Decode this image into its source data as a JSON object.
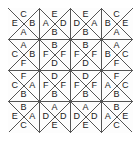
{
  "figure": {
    "kind": "triangle-tiling-letter-grid",
    "rows": 4,
    "cols": 4,
    "cell_size_px": 31,
    "origin_x_px": 8,
    "origin_y_px": 8,
    "line_color": "#555555",
    "border_color": "#444444",
    "background_color": "#fdfdfd",
    "letter_color": "#1a1a1a"
  },
  "legend": {
    "letters": [
      "A",
      "B",
      "C",
      "D",
      "E",
      "F"
    ]
  },
  "cells": [
    {
      "row": 0,
      "col": 0,
      "top": "C",
      "left": "E",
      "right": "B",
      "bottom": "A"
    },
    {
      "row": 0,
      "col": 1,
      "top": "E",
      "left": "A",
      "right": "D",
      "bottom": "B"
    },
    {
      "row": 0,
      "col": 2,
      "top": "E",
      "left": "D",
      "right": "A",
      "bottom": "B"
    },
    {
      "row": 0,
      "col": 3,
      "top": "C",
      "left": "B",
      "right": "E",
      "bottom": "A"
    },
    {
      "row": 1,
      "col": 0,
      "top": "A",
      "left": "C",
      "right": "B",
      "bottom": "F"
    },
    {
      "row": 1,
      "col": 1,
      "top": "B",
      "left": "F",
      "right": "F",
      "bottom": "D"
    },
    {
      "row": 1,
      "col": 2,
      "top": "B",
      "left": "F",
      "right": "F",
      "bottom": "D"
    },
    {
      "row": 1,
      "col": 3,
      "top": "A",
      "left": "B",
      "right": "C",
      "bottom": "F"
    },
    {
      "row": 2,
      "col": 0,
      "top": "F",
      "left": "C",
      "right": "A",
      "bottom": "B"
    },
    {
      "row": 2,
      "col": 1,
      "top": "D",
      "left": "F",
      "right": "F",
      "bottom": "B"
    },
    {
      "row": 2,
      "col": 2,
      "top": "D",
      "left": "F",
      "right": "F",
      "bottom": "B"
    },
    {
      "row": 2,
      "col": 3,
      "top": "F",
      "left": "A",
      "right": "C",
      "bottom": "B"
    },
    {
      "row": 3,
      "col": 0,
      "top": "B",
      "left": "E",
      "right": "A",
      "bottom": "C"
    },
    {
      "row": 3,
      "col": 1,
      "top": "A",
      "left": "D",
      "right": "D",
      "bottom": "E"
    },
    {
      "row": 3,
      "col": 2,
      "top": "A",
      "left": "D",
      "right": "D",
      "bottom": "E"
    },
    {
      "row": 3,
      "col": 3,
      "top": "B",
      "left": "A",
      "right": "E",
      "bottom": "C"
    }
  ]
}
